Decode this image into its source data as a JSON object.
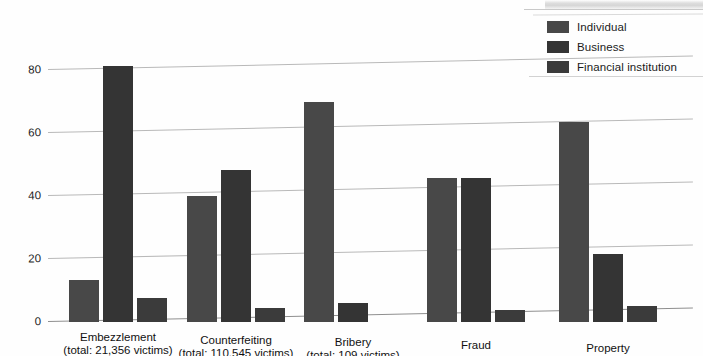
{
  "chart_data": {
    "type": "bar",
    "title": "",
    "subtitle": "",
    "xlabel": "",
    "ylabel": "",
    "ylim": [
      0,
      88
    ],
    "yticks": [
      0,
      20,
      40,
      60,
      80
    ],
    "ytick_labels": [
      "0",
      "20",
      "40",
      "60",
      "80"
    ],
    "grid": true,
    "legend_position": "top-right",
    "categories": [
      "Embezzlement",
      "Counterfeiting",
      "Bribery",
      "Fraud",
      "Property"
    ],
    "category_subtitles": [
      "(total: 21,356 victims)",
      "(total: 110,545 victims)",
      "(total: 109 victims)",
      "",
      ""
    ],
    "series": [
      {
        "name": "Individual",
        "color": "#484848",
        "values": [
          13,
          39,
          68,
          43,
          60
        ]
      },
      {
        "name": "Business",
        "color": "#343434",
        "values": [
          81,
          47,
          4,
          43,
          18
        ]
      },
      {
        "name": "Financial institution",
        "color": "#3b3b3b",
        "values": [
          7,
          3,
          0,
          0.6,
          1
        ]
      }
    ]
  },
  "legend": {
    "items": [
      {
        "label": "Individual",
        "color": "#484848"
      },
      {
        "label": "Business",
        "color": "#343434"
      },
      {
        "label": "Financial institution",
        "color": "#3b3b3b"
      }
    ]
  },
  "axis": {
    "y_tick_labels": [
      "0",
      "20",
      "40",
      "60",
      "80"
    ]
  },
  "x_axis": {
    "groups": [
      {
        "name": "Embezzlement",
        "total": "(total: 21,356 victims)"
      },
      {
        "name": "Counterfeiting",
        "total": "(total: 110,545 victims)"
      },
      {
        "name": "Bribery",
        "total": "(total: 109 victims)"
      },
      {
        "name": "Fraud",
        "total": ""
      },
      {
        "name": "Property",
        "total": ""
      }
    ]
  }
}
